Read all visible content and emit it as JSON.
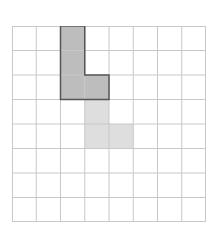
{
  "grid": {
    "rows": 8,
    "cols": 8,
    "line_color": "#c8c8c8"
  },
  "shapes": [
    {
      "name": "original-l-shape",
      "cells": [
        [
          2,
          0
        ],
        [
          2,
          1
        ],
        [
          2,
          2
        ],
        [
          3,
          2
        ]
      ],
      "fill": "#bdbdbd",
      "stroke": "#555555"
    },
    {
      "name": "translated-l-shape",
      "cells": [
        [
          3,
          3
        ],
        [
          3,
          4
        ],
        [
          4,
          4
        ]
      ],
      "fill": "#dedede",
      "stroke": "none"
    }
  ]
}
